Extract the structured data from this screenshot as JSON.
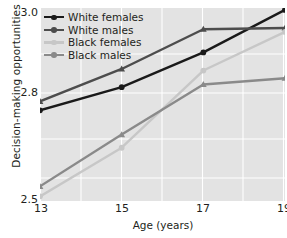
{
  "chart_data": {
    "type": "line",
    "title": "",
    "xlabel": "Age (years)",
    "ylabel": "Decision-making opportunities",
    "x": [
      13,
      15,
      17,
      19
    ],
    "xtick_labels": [
      "13",
      "15",
      "17",
      "19"
    ],
    "ytick_labels": [
      "2.5",
      "2.8",
      "3.0"
    ],
    "ytick_values": [
      2.5,
      2.8,
      3.0
    ],
    "xlim": [
      13,
      19
    ],
    "ylim": [
      2.5,
      3.0
    ],
    "grid": true,
    "grid_color": "#ffffff",
    "plot_background": "#e3e3e3",
    "legend_position": "top-left",
    "series": [
      {
        "name": "White females",
        "color": "#1a1a1a",
        "marker": "circle",
        "values": [
          2.735,
          2.795,
          2.885,
          2.995
        ]
      },
      {
        "name": "White males",
        "color": "#4d4d4d",
        "marker": "triangle",
        "values": [
          2.758,
          2.842,
          2.945,
          2.948
        ]
      },
      {
        "name": "Black females",
        "color": "#c7c7c7",
        "marker": "circle",
        "values": [
          2.512,
          2.638,
          2.838,
          2.938
        ]
      },
      {
        "name": "Black males",
        "color": "#8a8a8a",
        "marker": "triangle",
        "values": [
          2.538,
          2.672,
          2.802,
          2.818
        ]
      }
    ]
  },
  "axis": {
    "ylabel": "Decision-making opportunities",
    "xlabel": "Age (years)",
    "yticks": [
      "3.0",
      "2.8",
      "2.5"
    ],
    "xticks": [
      "13",
      "15",
      "17",
      "19"
    ]
  },
  "legend": {
    "items": [
      {
        "label": "White females"
      },
      {
        "label": "White males"
      },
      {
        "label": "Black females"
      },
      {
        "label": "Black males"
      }
    ]
  }
}
